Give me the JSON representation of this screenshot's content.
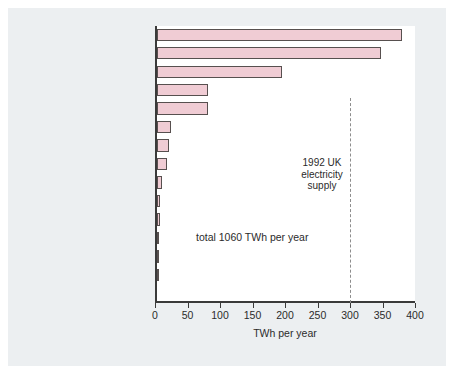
{
  "chart_data": {
    "type": "bar",
    "orientation": "horizontal",
    "title": "",
    "xlabel": "TWh per year",
    "ylabel": "",
    "xlim": [
      0,
      400
    ],
    "xticks": [
      0,
      50,
      100,
      150,
      200,
      250,
      300,
      350,
      400
    ],
    "grid": false,
    "legend": null,
    "bar_color": "#f0ccd4",
    "bar_edge_color": "#57504f",
    "categories": [
      "wind offshore",
      "wind onshore",
      "crops",
      "photoconversion",
      "photovoltaics",
      "tidal",
      "dry wastes (agricultural)",
      "refuse combustion",
      "landfill gas",
      "large-scale hydro",
      "dry wastes (industrial)",
      "small-scale hydro",
      "wet wastes",
      "wave*",
      "geothermal HDR"
    ],
    "values": [
      377,
      345,
      192,
      78,
      78,
      22,
      19,
      16,
      8,
      5,
      5,
      3,
      3,
      1.5,
      0
    ],
    "annotations": [
      {
        "name": "total-annotation",
        "text": "total 1060 TWh per year",
        "x": 60,
        "y_category": "dry wastes (industrial)"
      },
      {
        "name": "reference-line-label",
        "lines": [
          "1992 UK",
          "electricity",
          "supply"
        ],
        "value": 300,
        "line_style": "dashed",
        "line_color": "#8d8d8d"
      }
    ]
  },
  "chart": {
    "axis_title": "TWh per year",
    "total_label": "total 1060 TWh per year",
    "reference": {
      "line1": "1992 UK",
      "line2": "electricity",
      "line3": "supply"
    }
  }
}
